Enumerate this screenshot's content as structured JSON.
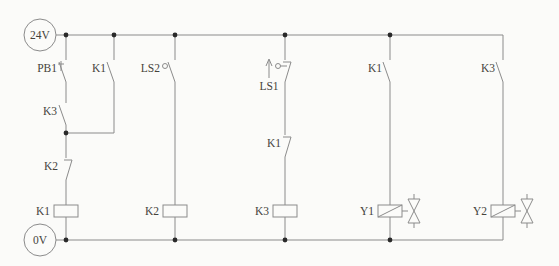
{
  "colors": {
    "background": "#fbfbf9",
    "line": "#8b8b8b",
    "text": "#45433c",
    "dot": "#2a2a2a"
  },
  "rails": {
    "top_label": "24V",
    "bottom_label": "0V"
  },
  "rungs": [
    {
      "id": 1,
      "elements": [
        {
          "label": "PB1",
          "type": "pushbutton-no-contact"
        },
        {
          "label": "K3",
          "type": "no-contact"
        },
        {
          "label": "K2",
          "type": "nc-contact"
        },
        {
          "label": "K1",
          "type": "relay-coil"
        }
      ],
      "branch": [
        {
          "label": "K1",
          "type": "no-contact",
          "parallel_with": "PB1+K3"
        }
      ]
    },
    {
      "id": 2,
      "elements": [
        {
          "label": "LS2",
          "type": "limit-switch-no-contact"
        },
        {
          "label": "K2",
          "type": "relay-coil"
        }
      ]
    },
    {
      "id": 3,
      "elements": [
        {
          "label": "LS1",
          "type": "limit-switch-nc-contact-up-arrow"
        },
        {
          "label": "K1",
          "type": "nc-contact"
        },
        {
          "label": "K3",
          "type": "relay-coil"
        }
      ]
    },
    {
      "id": 4,
      "elements": [
        {
          "label": "K1",
          "type": "no-contact"
        },
        {
          "label": "Y1",
          "type": "solenoid-valve-coil"
        }
      ]
    },
    {
      "id": 5,
      "elements": [
        {
          "label": "K3",
          "type": "no-contact"
        },
        {
          "label": "Y2",
          "type": "solenoid-valve-coil"
        }
      ]
    }
  ]
}
